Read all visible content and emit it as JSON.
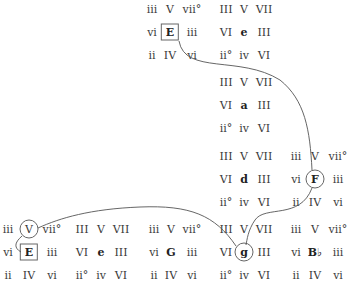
{
  "diagram": {
    "type": "tonal-region-chart",
    "regions": [
      {
        "key": "E",
        "mode": "major",
        "rows": [
          [
            "iii",
            "V",
            "vii°"
          ],
          [
            "vi",
            "E",
            "iii"
          ],
          [
            "ii",
            "IV",
            "vi"
          ]
        ],
        "col_x": [
          152,
          170,
          192
        ],
        "row_y": [
          9,
          32,
          55
        ],
        "marker": "box"
      },
      {
        "key": "e",
        "mode": "minor",
        "rows": [
          [
            "III",
            "V",
            "VII"
          ],
          [
            "VI",
            "e",
            "III"
          ],
          [
            "ii°",
            "iv",
            "VI"
          ]
        ],
        "col_x": [
          226,
          244,
          264
        ],
        "row_y": [
          9,
          32,
          55
        ],
        "marker": "none"
      },
      {
        "key": "a",
        "mode": "minor",
        "rows": [
          [
            "III",
            "V",
            "VII"
          ],
          [
            "VI",
            "a",
            "III"
          ],
          [
            "ii°",
            "iv",
            "VI"
          ]
        ],
        "col_x": [
          226,
          244,
          264
        ],
        "row_y": [
          82,
          105,
          128
        ],
        "marker": "none"
      },
      {
        "key": "d",
        "mode": "minor",
        "rows": [
          [
            "III",
            "V",
            "VII"
          ],
          [
            "VI",
            "d",
            "III"
          ],
          [
            "ii°",
            "iv",
            "VI"
          ]
        ],
        "col_x": [
          226,
          244,
          264
        ],
        "row_y": [
          156,
          179,
          202
        ],
        "marker": "none"
      },
      {
        "key": "F",
        "mode": "major",
        "rows": [
          [
            "iii",
            "V",
            "vii°"
          ],
          [
            "vi",
            "F",
            "iii"
          ],
          [
            "ii",
            "IV",
            "vi"
          ]
        ],
        "col_x": [
          296,
          315,
          338
        ],
        "row_y": [
          156,
          179,
          202
        ],
        "marker": "circle-tonic"
      },
      {
        "key": "E",
        "mode": "major",
        "rows": [
          [
            "iii",
            "V",
            "vii°"
          ],
          [
            "vi",
            "E",
            "iii"
          ],
          [
            "ii",
            "IV",
            "vi"
          ]
        ],
        "col_x": [
          8,
          29,
          52
        ],
        "row_y": [
          229,
          252,
          275
        ],
        "marker": "box-tonic-circle-dominant"
      },
      {
        "key": "e",
        "mode": "minor",
        "rows": [
          [
            "III",
            "V",
            "VII"
          ],
          [
            "VI",
            "e",
            "III"
          ],
          [
            "ii°",
            "iv",
            "VI"
          ]
        ],
        "col_x": [
          82,
          101,
          121
        ],
        "row_y": [
          229,
          252,
          275
        ],
        "marker": "none"
      },
      {
        "key": "G",
        "mode": "major",
        "rows": [
          [
            "iii",
            "V",
            "vii°"
          ],
          [
            "vi",
            "G",
            "iii"
          ],
          [
            "ii",
            "IV",
            "vi"
          ]
        ],
        "col_x": [
          154,
          171,
          192
        ],
        "row_y": [
          229,
          252,
          275
        ],
        "marker": "none"
      },
      {
        "key": "g",
        "mode": "minor",
        "rows": [
          [
            "III",
            "V",
            "VII"
          ],
          [
            "VI",
            "g",
            "III"
          ],
          [
            "ii°",
            "iv",
            "VI"
          ]
        ],
        "col_x": [
          226,
          244,
          264
        ],
        "row_y": [
          229,
          252,
          275
        ],
        "marker": "circle-tonic"
      },
      {
        "key": "B♭",
        "mode": "major",
        "rows": [
          [
            "iii",
            "V",
            "vii°"
          ],
          [
            "vi",
            "B♭",
            "iii"
          ],
          [
            "ii",
            "IV",
            "vi"
          ]
        ],
        "col_x": [
          296,
          315,
          338
        ],
        "row_y": [
          229,
          252,
          275
        ],
        "marker": "none"
      }
    ],
    "paths": [
      {
        "from": "E (top)",
        "to": "F",
        "d": "M179,41 C185,75 240,55 280,80 C305,100 310,130 312,170"
      },
      {
        "from": "F",
        "to": "g",
        "d": "M312,188 C300,220 265,205 255,220 C248,230 247,240 246,245"
      },
      {
        "from": "g",
        "to": "V of E",
        "d": "M236,246 C215,215 190,205 140,207 C90,209 60,218 38,228"
      },
      {
        "from": "V of E",
        "to": "E (bottom)",
        "d": "M22,236 C14,243 14,248 21,252"
      }
    ],
    "line_color": "#555555"
  }
}
